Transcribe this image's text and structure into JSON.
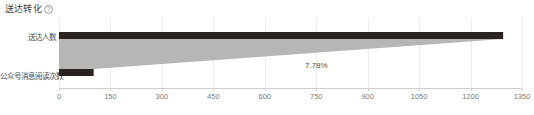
{
  "widget": {
    "title": "送达转化",
    "help_icon": "?",
    "help_icon_name": "help-circle-icon"
  },
  "chart_data": {
    "type": "bar",
    "title": "送达转化",
    "xlabel": "",
    "ylabel": "",
    "categories": [
      "送达人数",
      "公众号消息阅读次数"
    ],
    "values": [
      1295,
      101
    ],
    "xlim": [
      0,
      1350
    ],
    "grid": true,
    "legend": "none",
    "ticks": [
      "0",
      "150",
      "300",
      "450",
      "600",
      "750",
      "900",
      "1050",
      "1200",
      "1350"
    ],
    "tick_values": [
      0,
      150,
      300,
      450,
      600,
      750,
      900,
      1050,
      1200,
      1350
    ],
    "annotations": [
      {
        "label": "7.78%",
        "between": [
          "送达人数",
          "公众号消息阅读次数"
        ]
      }
    ],
    "series": [
      {
        "name": "送达人数",
        "value": 1295
      },
      {
        "name": "公众号消息阅读次数",
        "value": 101
      }
    ],
    "colors": {
      "bar": "#2b2320",
      "funnel_fill": "#b6b6b4",
      "grid": "#ededed",
      "axis": "#cfcfcf",
      "tick_text": "#7a7a7a",
      "title_text": "#3d3d3d",
      "rate_text": "#55514e"
    }
  }
}
